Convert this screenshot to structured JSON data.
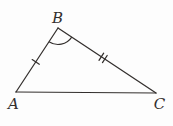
{
  "figure": {
    "type": "triangle-diagram",
    "vertices": [
      {
        "label": "A",
        "x": 16,
        "y": 92,
        "label_x": 13.5,
        "label_y": 108.5
      },
      {
        "label": "B",
        "x": 58,
        "y": 28,
        "label_x": 57.5,
        "label_y": 23
      },
      {
        "label": "C",
        "x": 156,
        "y": 93,
        "label_x": 159.5,
        "label_y": 109
      }
    ],
    "sides": [
      {
        "id": "ab",
        "from": "A",
        "to": "B",
        "tick_marks": 1,
        "tick_at": 0.47
      },
      {
        "id": "bc",
        "from": "B",
        "to": "C",
        "tick_marks": 2,
        "tick_at": 0.46
      },
      {
        "id": "ca",
        "from": "C",
        "to": "A",
        "tick_marks": 0,
        "tick_at": 0.5
      }
    ],
    "angle_marks": [
      {
        "vertex": "B",
        "toward_1": "A",
        "toward_2": "C",
        "radius": 16.5
      }
    ]
  },
  "style": {
    "stroke_color": "#332f2d",
    "background_color": "#fdfdfd",
    "stroke_width": 1.25,
    "tick_length": 8.5,
    "tick_spacing": 4.2,
    "label_font_size": 15
  }
}
